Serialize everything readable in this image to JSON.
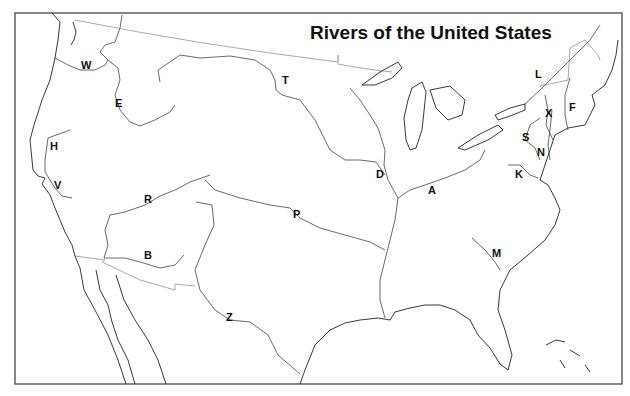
{
  "title": "Rivers of the United States",
  "labels": [
    {
      "id": "W",
      "x": 81,
      "y": 60
    },
    {
      "id": "E",
      "x": 115,
      "y": 98
    },
    {
      "id": "H",
      "x": 50,
      "y": 141
    },
    {
      "id": "V",
      "x": 54,
      "y": 180
    },
    {
      "id": "R",
      "x": 144,
      "y": 194
    },
    {
      "id": "B",
      "x": 144,
      "y": 250
    },
    {
      "id": "Z",
      "x": 226,
      "y": 312
    },
    {
      "id": "P",
      "x": 293,
      "y": 209
    },
    {
      "id": "T",
      "x": 282,
      "y": 75
    },
    {
      "id": "D",
      "x": 376,
      "y": 169
    },
    {
      "id": "A",
      "x": 428,
      "y": 185
    },
    {
      "id": "M",
      "x": 492,
      "y": 248
    },
    {
      "id": "L",
      "x": 535,
      "y": 69
    },
    {
      "id": "X",
      "x": 545,
      "y": 108
    },
    {
      "id": "F",
      "x": 569,
      "y": 102
    },
    {
      "id": "S",
      "x": 522,
      "y": 132
    },
    {
      "id": "N",
      "x": 537,
      "y": 147
    },
    {
      "id": "K",
      "x": 515,
      "y": 169
    }
  ]
}
